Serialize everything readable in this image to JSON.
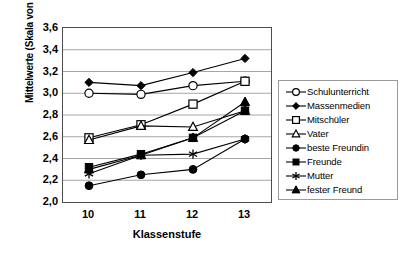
{
  "chart_data": {
    "type": "line",
    "title": "",
    "xlabel": "Klassenstufe",
    "ylabel": "Mittelwerte (Skala von 1 bis 5)",
    "categories": [
      "10",
      "11",
      "12",
      "13"
    ],
    "ylim": [
      2.0,
      3.6
    ],
    "yticks": [
      "3,6",
      "3,4",
      "3,2",
      "3,0",
      "2,8",
      "2,6",
      "2,4",
      "2,2",
      "2,0"
    ],
    "ytick_values": [
      3.6,
      3.4,
      3.2,
      3.0,
      2.8,
      2.6,
      2.4,
      2.2,
      2.0
    ],
    "grid": true,
    "legend_position": "right",
    "series": [
      {
        "name": "Schulunterricht",
        "marker": "open-circle",
        "values": [
          3.0,
          2.99,
          3.07,
          3.11
        ]
      },
      {
        "name": "Massenmedien",
        "marker": "filled-diamond",
        "values": [
          3.1,
          3.07,
          3.19,
          3.32
        ]
      },
      {
        "name": "Mitschüler",
        "marker": "open-square",
        "values": [
          2.59,
          2.71,
          2.9,
          3.11
        ]
      },
      {
        "name": "Vater",
        "marker": "open-triangle",
        "values": [
          2.57,
          2.7,
          2.69,
          2.84
        ]
      },
      {
        "name": "beste Freundin",
        "marker": "filled-circle",
        "values": [
          2.15,
          2.25,
          2.3,
          2.58
        ]
      },
      {
        "name": "Freunde",
        "marker": "filled-square",
        "values": [
          2.32,
          2.44,
          2.59,
          2.84
        ]
      },
      {
        "name": "Mutter",
        "marker": "asterisk",
        "values": [
          2.26,
          2.43,
          2.44,
          2.58
        ]
      },
      {
        "name": "fester Freund",
        "marker": "filled-triangle",
        "values": [
          2.3,
          2.43,
          2.59,
          2.92
        ]
      }
    ]
  },
  "colors": {
    "line": "#000000",
    "frame": "#4d4d4d",
    "grid": "#a6a6a6",
    "legend_border": "#9a9a9a",
    "background": "#ffffff"
  }
}
